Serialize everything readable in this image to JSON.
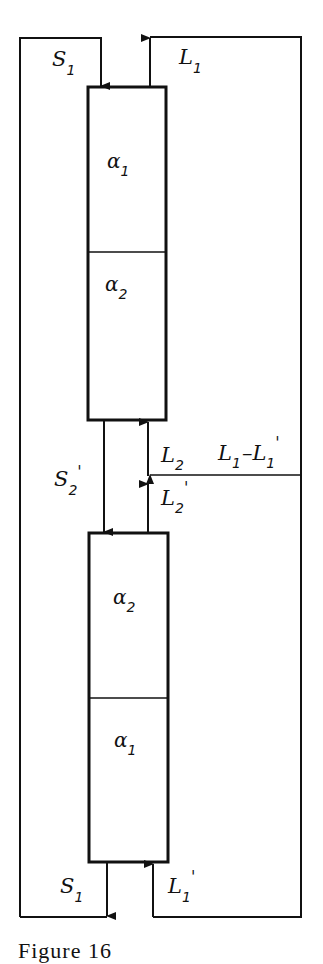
{
  "diagram": {
    "type": "two-column countercurrent separation flow scheme",
    "columns": [
      {
        "id": "upper-column",
        "sections": [
          {
            "label": "α",
            "subscript": "1"
          },
          {
            "label": "α",
            "subscript": "2"
          }
        ]
      },
      {
        "id": "lower-column",
        "sections": [
          {
            "label": "α",
            "subscript": "2"
          },
          {
            "label": "α",
            "subscript": "1"
          }
        ]
      }
    ],
    "streams": {
      "s1_top": {
        "label": "S",
        "subscript": "1",
        "prime": ""
      },
      "l1_top": {
        "label": "L",
        "subscript": "1",
        "prime": ""
      },
      "s2_prime": {
        "label": "S",
        "subscript": "2",
        "prime": "'"
      },
      "l2": {
        "label": "L",
        "subscript": "2",
        "prime": ""
      },
      "l2_prime": {
        "label": "L",
        "subscript": "2",
        "prime": "'"
      },
      "l1_minus_l1_prime": {
        "label_a": "L",
        "sub_a": "1",
        "minus": "–",
        "label_b": "L",
        "sub_b": "1",
        "prime_b": "'"
      },
      "s1_bottom": {
        "label": "S",
        "subscript": "1",
        "prime": ""
      },
      "l1_prime_bottom": {
        "label": "L",
        "subscript": "1",
        "prime": "'"
      }
    },
    "caption_fragment": "Figure 16"
  }
}
